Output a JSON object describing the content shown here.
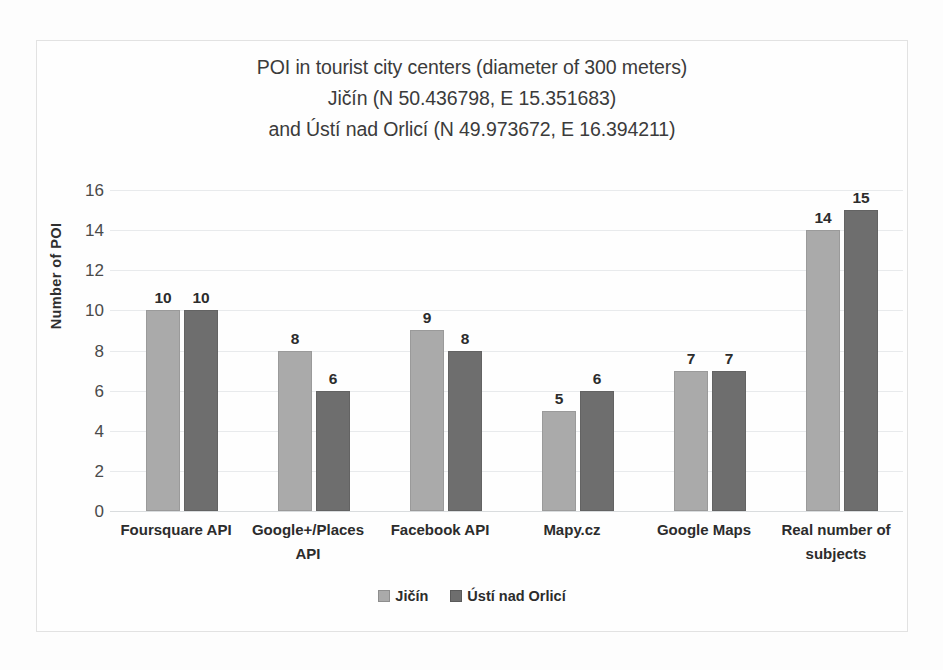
{
  "chart_data": {
    "type": "bar",
    "title": "POI in tourist city centers (diameter of 300 meters) Jičín (N 50.436798, E 15.351683) and Ústí nad Orlicí (N 49.973672, E 16.394211)",
    "title_lines": [
      "POI in tourist city centers (diameter of 300 meters)",
      "Jičín (N 50.436798, E 15.351683)",
      "and Ústí nad Orlicí (N 49.973672, E 16.394211)"
    ],
    "xlabel": "",
    "ylabel": "Number of POI",
    "ylim": [
      0,
      16
    ],
    "ytick_labels": [
      "0",
      "2",
      "4",
      "6",
      "8",
      "10",
      "12",
      "14",
      "16"
    ],
    "ytick_values": [
      0,
      2,
      4,
      6,
      8,
      10,
      12,
      14,
      16
    ],
    "grid": true,
    "grid_axis": "y",
    "legend_position": "bottom",
    "categories": [
      "Foursquare API",
      "Google+/Places API",
      "Facebook API",
      "Mapy.cz",
      "Google Maps",
      "Real number of subjects"
    ],
    "category_lines": [
      [
        "Foursquare API"
      ],
      [
        "Google+/Places",
        "API"
      ],
      [
        "Facebook API"
      ],
      [
        "Mapy.cz"
      ],
      [
        "Google Maps"
      ],
      [
        "Real number of",
        "subjects"
      ]
    ],
    "series": [
      {
        "name": "Jičín",
        "color": "#aaaaaa",
        "values": [
          10,
          8,
          9,
          5,
          7,
          14
        ],
        "labels": [
          "10",
          "8",
          "9",
          "5",
          "7",
          "14"
        ]
      },
      {
        "name": "Ústí nad Orlicí",
        "color": "#6e6e6e",
        "values": [
          10,
          6,
          8,
          6,
          7,
          15
        ],
        "labels": [
          "10",
          "6",
          "8",
          "6",
          "7",
          "15"
        ]
      }
    ]
  }
}
